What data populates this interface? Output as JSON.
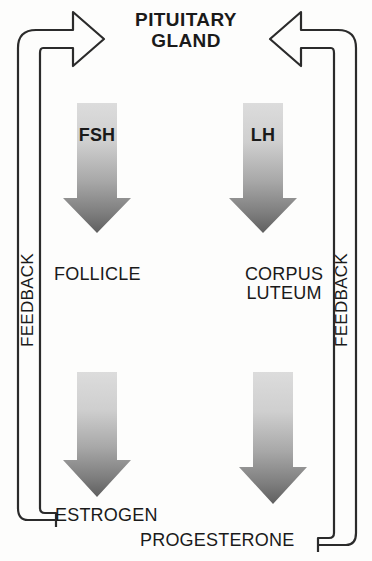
{
  "diagram": {
    "background_color": "#fdfdfc",
    "line_color": "#2b2b2b",
    "text_color": "#1a1a1a"
  },
  "nodes": {
    "pituitary": "PITUITARY\nGLAND",
    "fsh": "FSH",
    "lh": "LH",
    "follicle": "FOLLICLE",
    "corpus_luteum": "CORPUS\nLUTEUM",
    "estrogen": "ESTROGEN",
    "progesterone": "PROGESTERONE"
  },
  "feedback": {
    "left_label": "FEEDBACK",
    "right_label": "FEEDBACK"
  },
  "arrows": {
    "fsh_arrow": {
      "name": "fsh-down-arrow",
      "direction": "down",
      "gradient_top": "#d8d8d8",
      "gradient_bottom": "#6e6e6e"
    },
    "lh_arrow": {
      "name": "lh-down-arrow",
      "direction": "down",
      "gradient_top": "#d8d8d8",
      "gradient_bottom": "#6e6e6e"
    },
    "estrogen_arrow": {
      "name": "estrogen-down-arrow",
      "direction": "down",
      "gradient_top": "#d8d8d8",
      "gradient_bottom": "#6e6e6e"
    },
    "progesterone_arrow": {
      "name": "progesterone-down-arrow",
      "direction": "down",
      "gradient_top": "#d8d8d8",
      "gradient_bottom": "#6e6e6e"
    },
    "left_feedback_arrow": {
      "name": "left-feedback-hollow-arrow",
      "direction": "right",
      "style": "hollow-outline"
    },
    "right_feedback_arrow": {
      "name": "right-feedback-hollow-arrow",
      "direction": "left",
      "style": "hollow-outline"
    }
  }
}
